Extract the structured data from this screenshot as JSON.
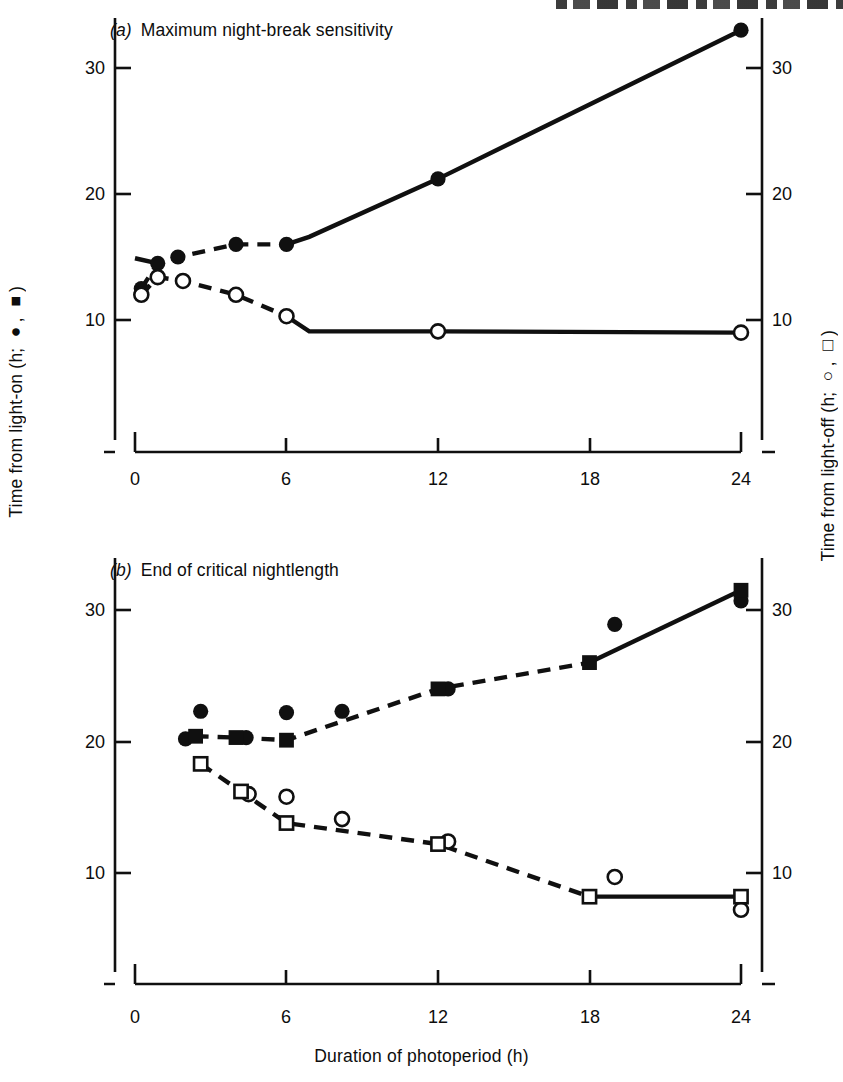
{
  "figure": {
    "axis_label_left": "Time from light-on (h; ●, ■)",
    "axis_label_right": "Time from light-off (h; ○, □)",
    "axis_label_bottom": "Duration of photoperiod (h)",
    "stroke_color": "#101010",
    "background": "#ffffff"
  },
  "chart_data": [
    {
      "type": "scatter",
      "panel": "a",
      "panel_label": "(a)",
      "title": "Maximum night-break sensitivity",
      "xlabel": "Duration of photoperiod (h)",
      "ylabel": "Time from light-on (h; ●, ■)",
      "ylabel_right": "Time from light-off (h; ○, □)",
      "xlim": [
        0,
        24
      ],
      "ylim": [
        4.8,
        34.6
      ],
      "xticks": [
        0,
        6,
        12,
        18,
        24
      ],
      "yticks": [
        10,
        20,
        30
      ],
      "yticks_right": [
        10,
        20,
        30
      ],
      "grid": false,
      "legend": false,
      "series": [
        {
          "name": "Time from light-on",
          "marker": "filled-circle",
          "axis": "left",
          "linestyle": "dashed-then-solid",
          "points": [
            {
              "x": 0.25,
              "y": 12.5
            },
            {
              "x": 0.9,
              "y": 14.5
            },
            {
              "x": 1.7,
              "y": 15.0
            },
            {
              "x": 4.0,
              "y": 16.0
            },
            {
              "x": 6.0,
              "y": 16.0
            },
            {
              "x": 12.0,
              "y": 21.2
            },
            {
              "x": 24.0,
              "y": 33.0
            }
          ]
        },
        {
          "name": "Time from light-off",
          "marker": "open-circle",
          "axis": "right",
          "linestyle": "dashed-then-solid",
          "points": [
            {
              "x": 0.25,
              "y": 12.0
            },
            {
              "x": 0.9,
              "y": 13.4
            },
            {
              "x": 1.9,
              "y": 13.1
            },
            {
              "x": 4.0,
              "y": 12.0
            },
            {
              "x": 6.0,
              "y": 10.3
            },
            {
              "x": 12.0,
              "y": 9.1
            },
            {
              "x": 24.0,
              "y": 9.0
            }
          ]
        }
      ]
    },
    {
      "type": "scatter",
      "panel": "b",
      "panel_label": "(b)",
      "title": "End of critical nightlength",
      "xlabel": "Duration of photoperiod (h)",
      "ylabel": "Time from light-on (h; ●, ■)",
      "ylabel_right": "Time from light-off (h; ○, □)",
      "xlim": [
        0,
        24
      ],
      "ylim": [
        4.2,
        34.0
      ],
      "xticks": [
        0,
        6,
        12,
        18,
        24
      ],
      "yticks": [
        10,
        20,
        30
      ],
      "yticks_right": [
        10,
        20,
        30
      ],
      "grid": false,
      "legend": false,
      "series": [
        {
          "name": "Time from light-on (circles)",
          "marker": "filled-circle",
          "axis": "left",
          "linestyle": "none",
          "points": [
            {
              "x": 2.0,
              "y": 20.2
            },
            {
              "x": 2.6,
              "y": 22.3
            },
            {
              "x": 4.4,
              "y": 20.3
            },
            {
              "x": 6.0,
              "y": 22.2
            },
            {
              "x": 8.2,
              "y": 22.3
            },
            {
              "x": 12.4,
              "y": 24.0
            },
            {
              "x": 19.0,
              "y": 28.9
            },
            {
              "x": 24.0,
              "y": 30.7
            }
          ]
        },
        {
          "name": "Time from light-on (squares)",
          "marker": "filled-square",
          "axis": "left",
          "linestyle": "dashed-then-solid",
          "points": [
            {
              "x": 2.4,
              "y": 20.4
            },
            {
              "x": 4.0,
              "y": 20.3
            },
            {
              "x": 6.0,
              "y": 20.1
            },
            {
              "x": 12.0,
              "y": 24.0
            },
            {
              "x": 18.0,
              "y": 26.0
            },
            {
              "x": 24.0,
              "y": 31.5
            }
          ]
        },
        {
          "name": "Time from light-off (circles)",
          "marker": "open-circle",
          "axis": "right",
          "linestyle": "none",
          "points": [
            {
              "x": 4.5,
              "y": 16.0
            },
            {
              "x": 6.0,
              "y": 15.8
            },
            {
              "x": 8.2,
              "y": 14.1
            },
            {
              "x": 12.4,
              "y": 12.4
            },
            {
              "x": 19.0,
              "y": 9.7
            },
            {
              "x": 24.0,
              "y": 7.2
            }
          ]
        },
        {
          "name": "Time from light-off (squares)",
          "marker": "open-square",
          "axis": "right",
          "linestyle": "dashed-then-solid",
          "points": [
            {
              "x": 2.6,
              "y": 18.3
            },
            {
              "x": 4.2,
              "y": 16.2
            },
            {
              "x": 6.0,
              "y": 13.8
            },
            {
              "x": 12.0,
              "y": 12.2
            },
            {
              "x": 18.0,
              "y": 8.2
            },
            {
              "x": 24.0,
              "y": 8.2
            }
          ]
        }
      ]
    }
  ]
}
